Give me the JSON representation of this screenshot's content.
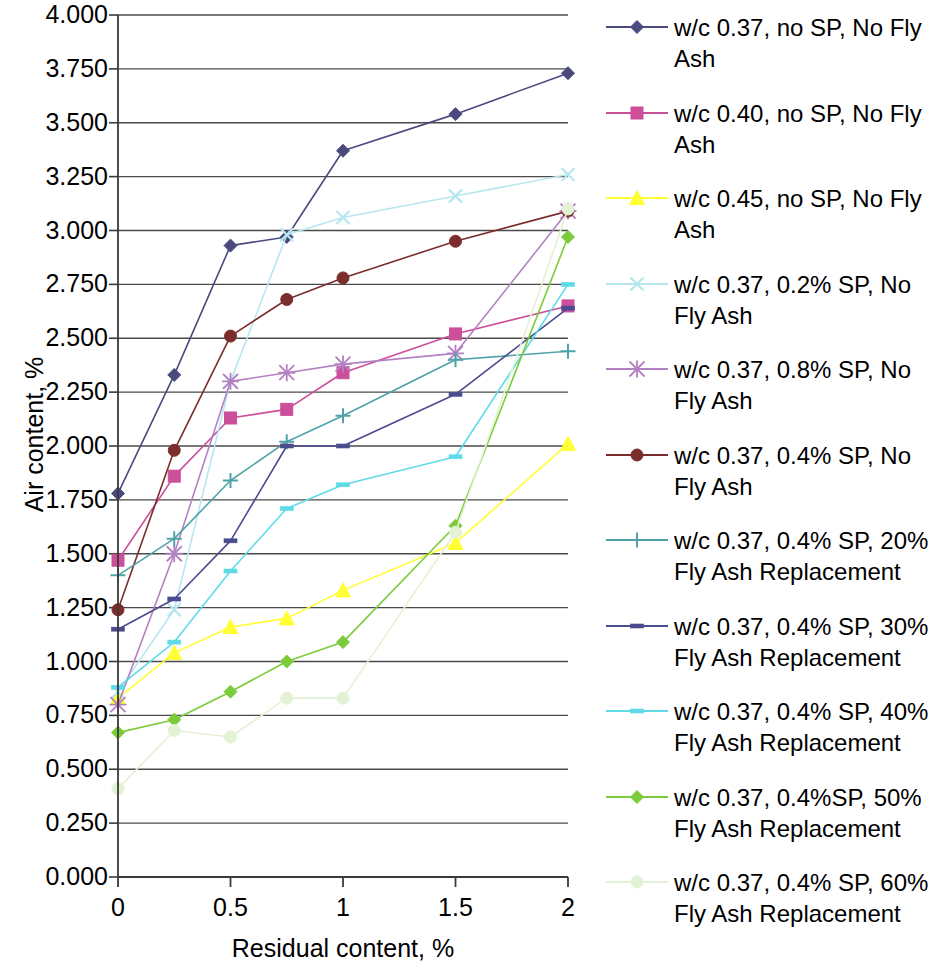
{
  "chart_data": {
    "type": "line",
    "title": "",
    "xlabel": "Residual content, %",
    "ylabel": "Air content, %",
    "xlim": [
      0,
      2
    ],
    "ylim": [
      0,
      4
    ],
    "xticks": [
      "0",
      "0.5",
      "1",
      "1.5",
      "2"
    ],
    "xtick_values": [
      0,
      0.5,
      1,
      1.5,
      2
    ],
    "yticks": [
      "0.000",
      "0.250",
      "0.500",
      "0.750",
      "1.000",
      "1.250",
      "1.500",
      "1.750",
      "2.000",
      "2.250",
      "2.500",
      "2.750",
      "3.000",
      "3.250",
      "3.500",
      "3.750",
      "4.000"
    ],
    "ytick_values": [
      0,
      0.25,
      0.5,
      0.75,
      1.0,
      1.25,
      1.5,
      1.75,
      2.0,
      2.25,
      2.5,
      2.75,
      3.0,
      3.25,
      3.5,
      3.75,
      4.0
    ],
    "grid": true,
    "grid_axis": "y",
    "legend_position": "right",
    "x": [
      0,
      0.25,
      0.5,
      0.75,
      1,
      1.5,
      2
    ],
    "series": [
      {
        "name": "w/c 0.37, no SP, No Fly Ash",
        "color": "#4a4a7f",
        "marker": "diamond",
        "values": [
          1.78,
          2.33,
          2.93,
          2.97,
          3.37,
          3.54,
          3.73
        ]
      },
      {
        "name": "w/c 0.40, no SP, No Fly Ash",
        "color": "#cc4f9a",
        "marker": "square",
        "values": [
          1.47,
          1.86,
          2.13,
          2.17,
          2.34,
          2.52,
          2.65
        ]
      },
      {
        "name": "w/c 0.45, no SP, No Fly Ash",
        "color": "#ffff33",
        "marker": "triangle",
        "values": [
          0.83,
          1.04,
          1.16,
          1.2,
          1.33,
          1.55,
          2.01
        ]
      },
      {
        "name": "w/c 0.37, 0.2% SP, No Fly Ash",
        "color": "#b6e7ef",
        "marker": "cross",
        "values": [
          0.86,
          1.24,
          2.3,
          2.98,
          3.06,
          3.16,
          3.26
        ]
      },
      {
        "name": "w/c 0.37, 0.8% SP, No Fly Ash",
        "color": "#b481c2",
        "marker": "star",
        "values": [
          0.8,
          1.5,
          2.3,
          2.34,
          2.38,
          2.43,
          3.09
        ]
      },
      {
        "name": "w/c 0.37, 0.4% SP, No Fly Ash",
        "color": "#7b2d2d",
        "marker": "circle",
        "values": [
          1.24,
          1.98,
          2.51,
          2.68,
          2.78,
          2.95,
          3.09
        ]
      },
      {
        "name": "w/c 0.37, 0.4% SP, 20% Fly Ash Replacement",
        "color": "#4fa3a8",
        "marker": "plus",
        "values": [
          1.4,
          1.57,
          1.84,
          2.02,
          2.14,
          2.4,
          2.44
        ]
      },
      {
        "name": "w/c 0.37, 0.4% SP, 30% Fly Ash Replacement",
        "color": "#4b4b8f",
        "marker": "dash",
        "values": [
          1.15,
          1.29,
          1.56,
          2.0,
          2.0,
          2.24,
          2.64
        ]
      },
      {
        "name": "w/c 0.37, 0.4% SP, 40% Fly Ash Replacement",
        "color": "#5fdbe8",
        "marker": "dash",
        "values": [
          0.88,
          1.09,
          1.42,
          1.71,
          1.82,
          1.95,
          2.75
        ]
      },
      {
        "name": "w/c 0.37, 0.4%SP, 50% Fly Ash Replacement",
        "color": "#7ccb3a",
        "marker": "diamond",
        "values": [
          0.67,
          0.73,
          0.86,
          1.0,
          1.09,
          1.63,
          2.97
        ]
      },
      {
        "name": "w/c 0.37, 0.4% SP, 60% Fly Ash Replacement",
        "color": "#e3f2d4",
        "marker": "circle",
        "values": [
          0.41,
          0.68,
          0.65,
          0.83,
          0.83,
          1.6,
          3.1
        ]
      }
    ]
  },
  "legend": {
    "entries": [
      {
        "label": "w/c 0.37, no SP, No Fly\nAsh",
        "color": "#4a4a7f",
        "marker": "diamond"
      },
      {
        "label": "w/c 0.40, no SP, No Fly\nAsh",
        "color": "#cc4f9a",
        "marker": "square"
      },
      {
        "label": "w/c 0.45, no SP, No Fly\nAsh",
        "color": "#ffff33",
        "marker": "triangle"
      },
      {
        "label": "w/c 0.37, 0.2% SP, No\nFly Ash",
        "color": "#b6e7ef",
        "marker": "cross"
      },
      {
        "label": "w/c 0.37, 0.8% SP, No\nFly Ash",
        "color": "#b481c2",
        "marker": "star"
      },
      {
        "label": "w/c 0.37, 0.4% SP, No\nFly Ash",
        "color": "#7b2d2d",
        "marker": "circle"
      },
      {
        "label": "w/c 0.37, 0.4% SP, 20%\nFly Ash Replacement",
        "color": "#4fa3a8",
        "marker": "plus"
      },
      {
        "label": "w/c 0.37, 0.4% SP, 30%\nFly Ash Replacement",
        "color": "#4b4b8f",
        "marker": "dash"
      },
      {
        "label": "w/c 0.37, 0.4% SP, 40%\nFly Ash Replacement",
        "color": "#5fdbe8",
        "marker": "dash"
      },
      {
        "label": "w/c 0.37, 0.4%SP, 50%\nFly Ash Replacement",
        "color": "#7ccb3a",
        "marker": "diamond"
      },
      {
        "label": "w/c 0.37, 0.4% SP, 60%\nFly Ash Replacement",
        "color": "#e3f2d4",
        "marker": "circle"
      }
    ]
  },
  "axes": {
    "x_title": "Residual content, %",
    "y_title": "Air content, %"
  },
  "colors": {
    "axis": "#3a3a3a",
    "grid": "#4a4a4a",
    "background": "#ffffff"
  }
}
